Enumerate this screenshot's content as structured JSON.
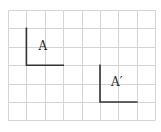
{
  "diagram": {
    "type": "grid-transformation",
    "grid": {
      "columns": 8,
      "rows": 6,
      "origin_x": 8,
      "origin_y": 10,
      "cell_size": 18.4,
      "line_color": "#d4d4d4"
    },
    "shapes": [
      {
        "name": "A",
        "label": "A",
        "points": [
          [
            1,
            1
          ],
          [
            1,
            3
          ],
          [
            3,
            3
          ]
        ],
        "label_pos": [
          1.65,
          2.15
        ],
        "color": "#333333"
      },
      {
        "name": "A-prime",
        "label": "A′",
        "points": [
          [
            5,
            3
          ],
          [
            5,
            5
          ],
          [
            7,
            5
          ]
        ],
        "label_pos": [
          5.6,
          4.15
        ],
        "color": "#333333"
      }
    ]
  }
}
